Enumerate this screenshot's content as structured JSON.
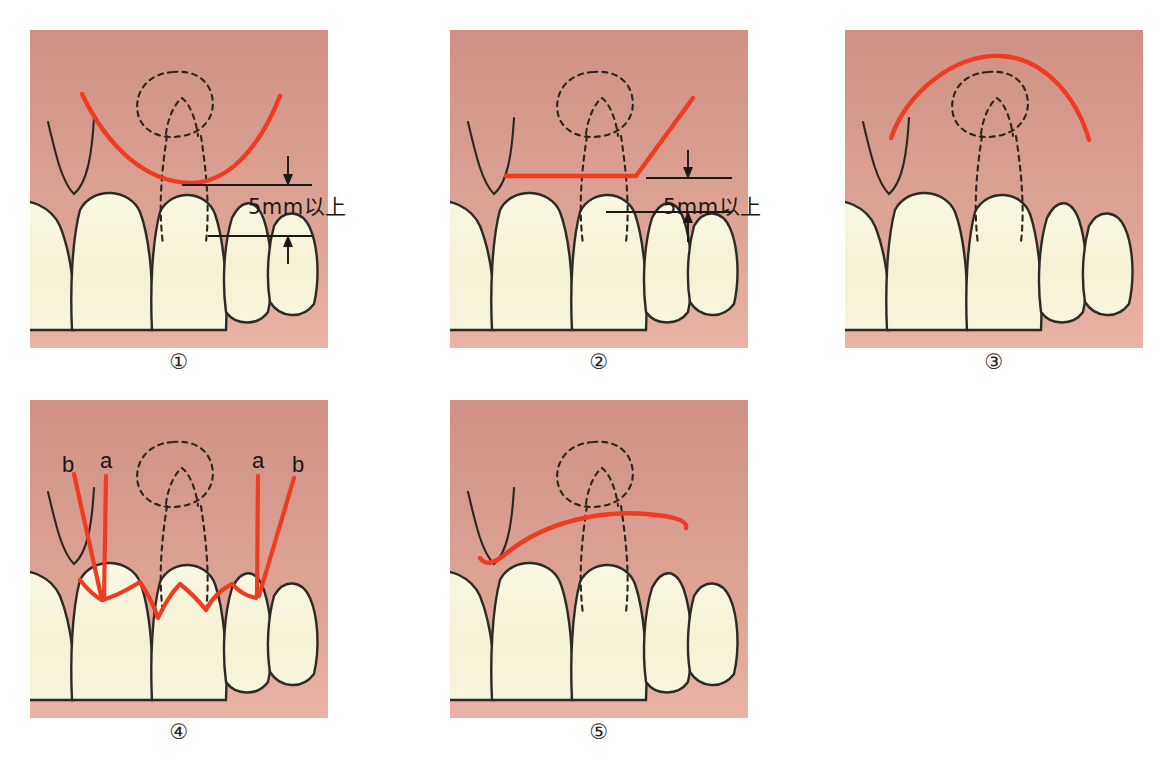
{
  "figure": {
    "background": "#ffffff",
    "width": 1169,
    "height": 764
  },
  "colors": {
    "incision_red": "#ee3b22",
    "gingiva_top": "#cf9184",
    "gingiva_bottom": "#e8ada0",
    "tooth_fill": "#f6f2d8",
    "tooth_outline": "#2b2a26",
    "dashed_outline": "#2b2520",
    "dimension_line": "#1c1815",
    "caption_text": "#2a2420"
  },
  "panels": [
    {
      "id": "panel-1",
      "caption": "①",
      "name": "curved-submarginal-incision",
      "incision_type": "curved",
      "has_dimension": true,
      "dimension_label": "5mm以上",
      "labels": []
    },
    {
      "id": "panel-2",
      "caption": "②",
      "name": "horizontal-with-oblique-release-incision",
      "incision_type": "angled",
      "has_dimension": true,
      "dimension_label": "5mm以上",
      "labels": []
    },
    {
      "id": "panel-3",
      "caption": "③",
      "name": "semilunar-incision",
      "incision_type": "arch",
      "has_dimension": false,
      "dimension_label": "",
      "labels": []
    },
    {
      "id": "panel-4",
      "caption": "④",
      "name": "sulcular-incision-with-vertical-releases",
      "incision_type": "sulcular",
      "has_dimension": false,
      "dimension_label": "",
      "labels": [
        {
          "text": "b",
          "x": 38,
          "y": 72
        },
        {
          "text": "a",
          "x": 76,
          "y": 68
        },
        {
          "text": "a",
          "x": 228,
          "y": 68
        },
        {
          "text": "b",
          "x": 266,
          "y": 72
        }
      ]
    },
    {
      "id": "panel-5",
      "caption": "⑤",
      "name": "shallow-curved-incision",
      "incision_type": "shallow-curve",
      "has_dimension": false,
      "dimension_label": "",
      "labels": []
    }
  ],
  "dimension_labels": [
    {
      "id": "dim-label-1",
      "text": "5mm以上"
    },
    {
      "id": "dim-label-2",
      "text": "5mm以上"
    }
  ]
}
